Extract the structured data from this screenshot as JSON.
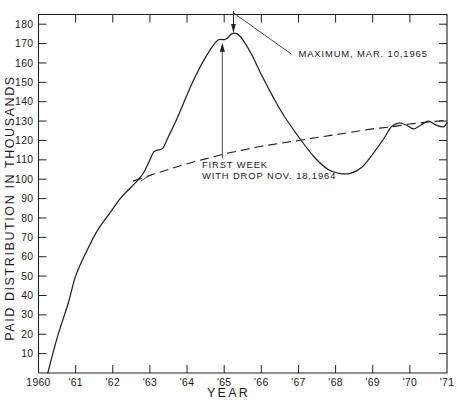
{
  "figure": {
    "xlabel": "YEAR",
    "ylabel": "PAID DISTRIBUTION IN THOUSANDS",
    "caption": ""
  },
  "chart_data": {
    "type": "line",
    "title": "",
    "xlabel": "YEAR",
    "ylabel": "PAID DISTRIBUTION IN THOUSANDS",
    "xlim": [
      1960,
      1971
    ],
    "ylim": [
      0,
      185
    ],
    "xtick_labels": [
      "1960",
      "'61",
      "'62",
      "'63",
      "'64",
      "'65",
      "'66",
      "'67",
      "'68",
      "'69",
      "'70",
      "'71"
    ],
    "xticks": [
      1960,
      1961,
      1962,
      1963,
      1964,
      1965,
      1966,
      1967,
      1968,
      1969,
      1970,
      1971
    ],
    "yticks": [
      10,
      20,
      30,
      40,
      50,
      60,
      70,
      80,
      90,
      100,
      110,
      120,
      130,
      140,
      150,
      160,
      170,
      180
    ],
    "ytick_labels": [
      "10",
      "20",
      "30",
      "40",
      "50",
      "60",
      "70",
      "80",
      "90",
      "100",
      "110",
      "120",
      "130",
      "140",
      "150",
      "160",
      "170",
      "180"
    ],
    "grid": false,
    "legend": false,
    "series": [
      {
        "name": "actual paid distribution",
        "style": "solid",
        "x": [
          1960.25,
          1960.5,
          1960.8,
          1961.0,
          1961.3,
          1961.6,
          1961.9,
          1962.2,
          1962.5,
          1962.7,
          1962.85,
          1963.0,
          1963.1,
          1963.2,
          1963.35,
          1963.5,
          1963.7,
          1963.9,
          1964.1,
          1964.3,
          1964.5,
          1964.7,
          1964.85,
          1965.0,
          1965.1,
          1965.2,
          1965.35,
          1965.5,
          1965.75,
          1966.0,
          1966.3,
          1966.6,
          1967.0,
          1967.4,
          1967.8,
          1968.1,
          1968.4,
          1968.7,
          1969.0,
          1969.3,
          1969.5,
          1969.7,
          1969.9,
          1970.1,
          1970.3,
          1970.5,
          1970.7,
          1970.9,
          1971.0
        ],
        "y": [
          0,
          18,
          36,
          50,
          63,
          74,
          82,
          90,
          96,
          100,
          104,
          110,
          114,
          115,
          116,
          122,
          130,
          139,
          148,
          156,
          163,
          169,
          172,
          172,
          173,
          175,
          175,
          172,
          164,
          154,
          143,
          133,
          122,
          112,
          105,
          103,
          103,
          106,
          113,
          121,
          127,
          129,
          128,
          126,
          128,
          130,
          128,
          127,
          129
        ]
      },
      {
        "name": "trend line",
        "style": "dashed",
        "x": [
          1962.55,
          1963.0,
          1963.5,
          1964.0,
          1964.5,
          1965.0,
          1965.5,
          1966.0,
          1966.5,
          1967.0,
          1967.5,
          1968.0,
          1968.5,
          1969.0,
          1969.5,
          1970.0,
          1970.5,
          1971.0
        ],
        "y": [
          99,
          102,
          105,
          108,
          110.5,
          113,
          115,
          117,
          118.5,
          120,
          121.5,
          123,
          124.5,
          126,
          127,
          128.5,
          129.5,
          130.5
        ]
      }
    ],
    "annotations": [
      {
        "name": "maximum",
        "text": "MAXIMUM, MAR. 10,1965",
        "point_x": 1965.25,
        "point_y": 176,
        "label_x": 1967.0,
        "label_y": 163
      },
      {
        "name": "first-week-with-drop",
        "text_line1": "FIRST  WEEK",
        "text_line2": "WITH DROP NOV. 18,1964",
        "point_x": 1964.95,
        "point_y": 172,
        "label_x": 1964.4,
        "label_y": 100
      }
    ]
  }
}
